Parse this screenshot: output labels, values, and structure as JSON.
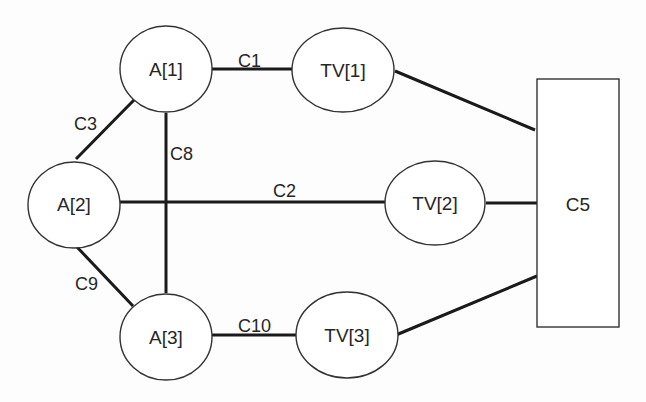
{
  "diagram": {
    "type": "network-graph",
    "nodes": [
      {
        "id": "A1",
        "label": "A[1]",
        "shape": "ellipse",
        "cx": 166,
        "cy": 69,
        "rx": 46,
        "ry": 43
      },
      {
        "id": "TV1",
        "label": "TV[1]",
        "shape": "ellipse",
        "cx": 343,
        "cy": 70,
        "rx": 51,
        "ry": 42
      },
      {
        "id": "A2",
        "label": "A[2]",
        "shape": "ellipse",
        "cx": 74,
        "cy": 205,
        "rx": 46,
        "ry": 43
      },
      {
        "id": "TV2",
        "label": "TV[2]",
        "shape": "ellipse",
        "cx": 435,
        "cy": 203,
        "rx": 50,
        "ry": 42
      },
      {
        "id": "A3",
        "label": "A[3]",
        "shape": "ellipse",
        "cx": 166,
        "cy": 337,
        "rx": 46,
        "ry": 43
      },
      {
        "id": "TV3",
        "label": "TV[3]",
        "shape": "ellipse",
        "cx": 347,
        "cy": 335,
        "rx": 51,
        "ry": 43
      },
      {
        "id": "C5",
        "label": "C5",
        "shape": "rectangle",
        "x": 537,
        "y": 79,
        "width": 82,
        "height": 248
      }
    ],
    "edges": [
      {
        "id": "C1",
        "label": "C1",
        "from": "A1",
        "to": "TV1"
      },
      {
        "id": "C2",
        "label": "C2",
        "from": "A2",
        "to": "TV2"
      },
      {
        "id": "C3",
        "label": "C3",
        "from": "A1",
        "to": "A2"
      },
      {
        "id": "C8",
        "label": "C8",
        "from": "A1",
        "to": "A3"
      },
      {
        "id": "C9",
        "label": "C9",
        "from": "A2",
        "to": "A3"
      },
      {
        "id": "C10",
        "label": "C10",
        "from": "A3",
        "to": "TV3"
      },
      {
        "id": "TV1-C5",
        "label": "",
        "from": "TV1",
        "to": "C5"
      },
      {
        "id": "TV2-C5",
        "label": "",
        "from": "TV2",
        "to": "C5"
      },
      {
        "id": "TV3-C5",
        "label": "",
        "from": "TV3",
        "to": "C5"
      }
    ],
    "colors": {
      "line": "#1a1a1a",
      "outline": "#333333",
      "text": "#262626",
      "background": "#fdfdfd"
    }
  }
}
